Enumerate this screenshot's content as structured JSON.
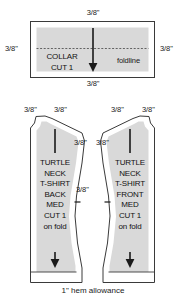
{
  "diagram": {
    "title_text": "Turtle Neck T-Shirt cutting layout",
    "fabric_fill": "#d9d9d9",
    "outline_color": "#3a3a3a",
    "grainline_color": "#1a1a1a"
  },
  "collar": {
    "label_line1": "COLLAR",
    "label_line2": "CUT 1",
    "foldline_label": "foldline",
    "seam_top": "3/8\"",
    "seam_left": "3/8\"",
    "seam_right": "3/8\"",
    "seam_bottom": "3/8\""
  },
  "back_piece": {
    "line1": "TURTLE",
    "line2": "NECK",
    "line3": "T-SHIRT",
    "line4": "BACK",
    "line5": "MED",
    "line6": "CUT 1",
    "line7": "on fold",
    "seam_shoulder_outer": "3/8\"",
    "seam_shoulder_inner": "3/8\"",
    "seam_side_upper": "3/8\"",
    "seam_side_lower": "3/8\""
  },
  "front_piece": {
    "line1": "TURTLE",
    "line2": "NECK",
    "line3": "T-SHIRT",
    "line4": "FRONT",
    "line5": "MED",
    "line6": "CUT 1",
    "line7": "on fold",
    "seam_shoulder_inner": "3/8\"",
    "seam_shoulder_outer": "3/8\"",
    "seam_side_upper": "3/8\"",
    "seam_side_lower": "3/8\""
  },
  "hem": {
    "allowance_label": "1\" hem allowance"
  }
}
